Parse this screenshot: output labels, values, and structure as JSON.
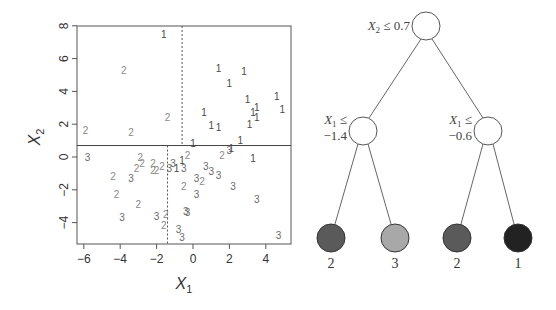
{
  "scatter": {
    "xlabel": "X",
    "xlabel_sub": "1",
    "ylabel": "X",
    "ylabel_sub": "2",
    "x_ticks": [
      "-6",
      "-4",
      "-2",
      "0",
      "2",
      "4"
    ],
    "y_ticks": [
      "-4",
      "-2",
      "0",
      "2",
      "4",
      "6",
      "8"
    ],
    "split_x2": 0.7,
    "split_x1_lower": -1.4,
    "split_x1_upper": -0.6
  },
  "tree": {
    "root": {
      "var": "X",
      "sub": "2",
      "rel": "≤",
      "value": "0.7"
    },
    "left": {
      "var": "X",
      "sub": "1",
      "rel": "≤",
      "value": "−1.4"
    },
    "right": {
      "var": "X",
      "sub": "1",
      "rel": "≤",
      "value": "−0.6"
    },
    "leaves": [
      {
        "label": "2",
        "color": "#5a5a5a"
      },
      {
        "label": "3",
        "color": "#a8a8a8"
      },
      {
        "label": "2",
        "color": "#5a5a5a"
      },
      {
        "label": "1",
        "color": "#222222"
      }
    ]
  },
  "class_colors": {
    "1": "#4a4a4a",
    "2": "#8a8a8a",
    "3": "#6a6a6a"
  },
  "chart_data": {
    "type": "scatter",
    "title": "",
    "xlabel": "X1",
    "ylabel": "X2",
    "xlim": [
      -6.3,
      5.4
    ],
    "ylim": [
      -5.3,
      8.0
    ],
    "x_ticks": [
      -6,
      -4,
      -2,
      0,
      2,
      4
    ],
    "y_ticks": [
      -4,
      -2,
      0,
      2,
      4,
      6,
      8
    ],
    "grid": false,
    "marker": "class label text",
    "partition_lines": [
      {
        "orientation": "horizontal",
        "x2": 0.7,
        "style": "solid",
        "span_x1": [
          -6.3,
          5.4
        ]
      },
      {
        "orientation": "vertical",
        "x1": -1.4,
        "style": "dotted",
        "span_x2": [
          -5.3,
          0.7
        ]
      },
      {
        "orientation": "vertical",
        "x1": -0.6,
        "style": "dotted",
        "span_x2": [
          0.7,
          8.0
        ]
      }
    ],
    "points": [
      {
        "x1": -1.6,
        "x2": 7.5,
        "class": "1"
      },
      {
        "x1": -3.8,
        "x2": 5.3,
        "class": "2"
      },
      {
        "x1": 1.4,
        "x2": 5.4,
        "class": "1"
      },
      {
        "x1": 2.8,
        "x2": 5.2,
        "class": "1"
      },
      {
        "x1": 2.0,
        "x2": 4.5,
        "class": "1"
      },
      {
        "x1": 3.0,
        "x2": 3.5,
        "class": "1"
      },
      {
        "x1": 4.6,
        "x2": 3.7,
        "class": "1"
      },
      {
        "x1": 0.6,
        "x2": 2.7,
        "class": "1"
      },
      {
        "x1": 3.3,
        "x2": 2.7,
        "class": "1"
      },
      {
        "x1": 3.5,
        "x2": 3.0,
        "class": "1"
      },
      {
        "x1": 3.5,
        "x2": 2.4,
        "class": "1"
      },
      {
        "x1": 4.9,
        "x2": 2.9,
        "class": "1"
      },
      {
        "x1": -1.4,
        "x2": 2.4,
        "class": "2"
      },
      {
        "x1": -5.9,
        "x2": 1.6,
        "class": "2"
      },
      {
        "x1": -3.4,
        "x2": 1.5,
        "class": "2"
      },
      {
        "x1": 1.0,
        "x2": 1.9,
        "class": "1"
      },
      {
        "x1": 1.4,
        "x2": 1.8,
        "class": "1"
      },
      {
        "x1": 3.1,
        "x2": 2.0,
        "class": "1"
      },
      {
        "x1": 2.6,
        "x2": 1.0,
        "class": "1"
      },
      {
        "x1": 0.0,
        "x2": 0.8,
        "class": "1"
      },
      {
        "x1": -5.8,
        "x2": 0.0,
        "class": "3"
      },
      {
        "x1": -2.9,
        "x2": 0.0,
        "class": "2"
      },
      {
        "x1": -2.8,
        "x2": -0.4,
        "class": "2"
      },
      {
        "x1": -3.1,
        "x2": -0.7,
        "class": "2"
      },
      {
        "x1": -2.2,
        "x2": -0.4,
        "class": "2"
      },
      {
        "x1": -2.2,
        "x2": -0.8,
        "class": "2"
      },
      {
        "x1": -2.0,
        "x2": -0.8,
        "class": "2"
      },
      {
        "x1": -1.7,
        "x2": -0.6,
        "class": "2"
      },
      {
        "x1": -1.3,
        "x2": -0.7,
        "class": "3"
      },
      {
        "x1": -1.1,
        "x2": -0.4,
        "class": "3"
      },
      {
        "x1": -0.9,
        "x2": -0.7,
        "class": "1"
      },
      {
        "x1": -0.6,
        "x2": -0.2,
        "class": "1"
      },
      {
        "x1": -0.3,
        "x2": 0.1,
        "class": "2"
      },
      {
        "x1": -0.5,
        "x2": -0.7,
        "class": "3"
      },
      {
        "x1": 1.6,
        "x2": 0.1,
        "class": "2"
      },
      {
        "x1": 2.0,
        "x2": 0.4,
        "class": "3"
      },
      {
        "x1": 2.1,
        "x2": 0.5,
        "class": "1"
      },
      {
        "x1": 3.3,
        "x2": -0.1,
        "class": "1"
      },
      {
        "x1": 0.7,
        "x2": -0.6,
        "class": "3"
      },
      {
        "x1": 1.0,
        "x2": -0.9,
        "class": "3"
      },
      {
        "x1": 1.4,
        "x2": -1.1,
        "class": "3"
      },
      {
        "x1": 0.2,
        "x2": -1.3,
        "class": "3"
      },
      {
        "x1": 0.5,
        "x2": -1.5,
        "class": "2"
      },
      {
        "x1": -4.4,
        "x2": -1.2,
        "class": "2"
      },
      {
        "x1": -3.4,
        "x2": -1.3,
        "class": "3"
      },
      {
        "x1": -0.5,
        "x2": -1.8,
        "class": "2"
      },
      {
        "x1": 2.2,
        "x2": -1.8,
        "class": "3"
      },
      {
        "x1": -4.2,
        "x2": -2.3,
        "class": "2"
      },
      {
        "x1": 0.2,
        "x2": -2.3,
        "class": "3"
      },
      {
        "x1": 3.5,
        "x2": -2.6,
        "class": "3"
      },
      {
        "x1": -3.0,
        "x2": -2.9,
        "class": "2"
      },
      {
        "x1": -0.4,
        "x2": -3.3,
        "class": "3"
      },
      {
        "x1": -0.3,
        "x2": -3.4,
        "class": "3"
      },
      {
        "x1": -3.9,
        "x2": -3.7,
        "class": "3"
      },
      {
        "x1": -2.0,
        "x2": -3.6,
        "class": "3"
      },
      {
        "x1": -1.5,
        "x2": -3.5,
        "class": "2"
      },
      {
        "x1": -1.6,
        "x2": -4.2,
        "class": "2"
      },
      {
        "x1": -0.8,
        "x2": -4.4,
        "class": "3"
      },
      {
        "x1": -0.6,
        "x2": -4.9,
        "class": "3"
      },
      {
        "x1": 4.7,
        "x2": -4.8,
        "class": "3"
      }
    ],
    "tree": {
      "root": "X2 ≤ 0.7",
      "left_child": "X1 ≤ -1.4",
      "right_child": "X1 ≤ -0.6",
      "leaves": [
        "2",
        "3",
        "2",
        "1"
      ]
    }
  }
}
